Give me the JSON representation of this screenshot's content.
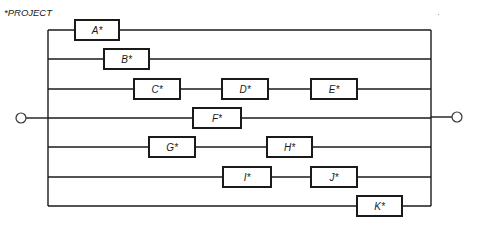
{
  "title": "*PROJECT",
  "bus": {
    "left_x": 48,
    "right_x": 431,
    "top_y": 30,
    "bottom_y": 206
  },
  "terminals": {
    "input": {
      "cx": 21,
      "cy": 118,
      "r": 5
    },
    "output": {
      "cx": 457,
      "cy": 117,
      "r": 5
    }
  },
  "rows": [
    {
      "y": 30,
      "boxes": [
        {
          "label": "A*",
          "x": 75,
          "w": 44
        }
      ]
    },
    {
      "y": 59,
      "boxes": [
        {
          "label": "B*",
          "x": 104,
          "w": 45
        }
      ]
    },
    {
      "y": 89,
      "boxes": [
        {
          "label": "C*",
          "x": 134,
          "w": 46
        },
        {
          "label": "D*",
          "x": 222,
          "w": 46
        },
        {
          "label": "E*",
          "x": 311,
          "w": 46
        }
      ]
    },
    {
      "y": 118,
      "boxes": [
        {
          "label": "F*",
          "x": 193,
          "w": 48
        }
      ]
    },
    {
      "y": 147,
      "boxes": [
        {
          "label": "G*",
          "x": 149,
          "w": 46
        },
        {
          "label": "H*",
          "x": 267,
          "w": 45
        }
      ]
    },
    {
      "y": 177,
      "boxes": [
        {
          "label": "I*",
          "x": 223,
          "w": 48
        },
        {
          "label": "J*",
          "x": 311,
          "w": 46
        }
      ]
    },
    {
      "y": 206,
      "boxes": [
        {
          "label": "K*",
          "x": 357,
          "w": 45
        }
      ]
    }
  ],
  "box_height": 20
}
